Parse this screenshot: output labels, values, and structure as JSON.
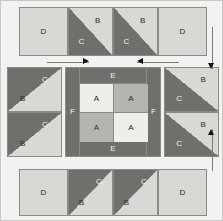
{
  "diagram": {
    "type": "quilt-block-layout",
    "canvas": {
      "width": 223,
      "height": 221
    },
    "colors": {
      "background": "#f2f2f0",
      "light": "#d8d8d4",
      "very_light": "#eeeeea",
      "medium": "#b4b4b0",
      "dark": "#6f6f6b",
      "seam": "#8a8a86",
      "arrow": "#111111",
      "label_dark": "#2b2b2b",
      "label_light": "#f4f4f2"
    },
    "patch_letters": {
      "A": "A",
      "B": "B",
      "C": "C",
      "D": "D",
      "E": "E",
      "F": "F"
    }
  },
  "rows": {
    "top": {
      "name": "top-row",
      "units": [
        {
          "id": "top-square-left",
          "kind": "square",
          "label": "D",
          "fill": "light",
          "x": 18,
          "y": 6,
          "w": 49,
          "h": 49
        },
        {
          "id": "top-hst-1",
          "kind": "hst",
          "labels": {
            "light": "B",
            "dark": "C"
          },
          "orientation": "dark-lower-left",
          "x": 67,
          "y": 6,
          "w": 45,
          "h": 49
        },
        {
          "id": "top-hst-2",
          "kind": "hst",
          "labels": {
            "light": "B",
            "dark": "C"
          },
          "orientation": "dark-lower-left",
          "x": 112,
          "y": 6,
          "w": 45,
          "h": 49
        },
        {
          "id": "top-square-right",
          "kind": "square",
          "label": "D",
          "fill": "light",
          "x": 157,
          "y": 6,
          "w": 49,
          "h": 49
        }
      ]
    },
    "middle": {
      "name": "middle-row",
      "left_units": [
        {
          "id": "left-hst-top",
          "kind": "hst",
          "labels": {
            "light": "B",
            "dark": "C"
          },
          "orientation": "dark-upper-right",
          "x": 6,
          "y": 66,
          "w": 55,
          "h": 45
        },
        {
          "id": "left-hst-bottom",
          "kind": "hst",
          "labels": {
            "light": "B",
            "dark": "C"
          },
          "orientation": "dark-upper-right",
          "x": 6,
          "y": 111,
          "w": 55,
          "h": 45
        }
      ],
      "right_units": [
        {
          "id": "right-hst-top",
          "kind": "hst",
          "labels": {
            "light": "B",
            "dark": "C"
          },
          "orientation": "dark-lower-left",
          "x": 163,
          "y": 66,
          "w": 55,
          "h": 45
        },
        {
          "id": "right-hst-bottom",
          "kind": "hst",
          "labels": {
            "light": "B",
            "dark": "C"
          },
          "orientation": "dark-lower-left",
          "x": 163,
          "y": 111,
          "w": 55,
          "h": 45
        }
      ],
      "center": {
        "id": "center-unit",
        "x": 64,
        "y": 66,
        "w": 96,
        "h": 90,
        "sashing_side": {
          "label": "F",
          "fill": "dark",
          "width": 14
        },
        "sashing_endcap": {
          "label": "E",
          "fill": "dark",
          "height": 16
        },
        "four_patch": {
          "x": 14,
          "y": 16,
          "w": 68,
          "h": 58,
          "cells": [
            {
              "id": "four-patch-a-tl",
              "label": "A",
              "fill": "very_light"
            },
            {
              "id": "four-patch-a-tr",
              "label": "A",
              "fill": "medium"
            },
            {
              "id": "four-patch-a-bl",
              "label": "A",
              "fill": "medium"
            },
            {
              "id": "four-patch-a-br",
              "label": "A",
              "fill": "very_light"
            }
          ]
        }
      }
    },
    "bottom": {
      "name": "bottom-row",
      "units": [
        {
          "id": "bottom-square-left",
          "kind": "square",
          "label": "D",
          "fill": "light",
          "x": 18,
          "y": 168,
          "w": 49,
          "h": 47
        },
        {
          "id": "bottom-hst-1",
          "kind": "hst",
          "labels": {
            "light": "B",
            "dark": "C"
          },
          "orientation": "dark-upper-right",
          "x": 67,
          "y": 168,
          "w": 45,
          "h": 47
        },
        {
          "id": "bottom-hst-2",
          "kind": "hst",
          "labels": {
            "light": "B",
            "dark": "C"
          },
          "orientation": "dark-upper-right",
          "x": 112,
          "y": 168,
          "w": 45,
          "h": 47
        },
        {
          "id": "bottom-square-right",
          "kind": "square",
          "label": "D",
          "fill": "light",
          "x": 157,
          "y": 168,
          "w": 49,
          "h": 47
        }
      ]
    }
  },
  "arrows": [
    {
      "id": "arrow-left-inward",
      "direction": "right",
      "x": 46,
      "y": 56,
      "w": 42,
      "h": 9
    },
    {
      "id": "arrow-right-inward",
      "direction": "left",
      "x": 136,
      "y": 56,
      "w": 42,
      "h": 9
    },
    {
      "id": "arrow-top-inward",
      "direction": "down",
      "x": 206,
      "y": 26,
      "w": 9,
      "h": 42
    },
    {
      "id": "arrow-bottom-inward",
      "direction": "up",
      "x": 206,
      "y": 128,
      "w": 9,
      "h": 42
    }
  ]
}
